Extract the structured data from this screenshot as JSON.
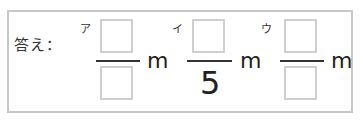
{
  "answer": {
    "label": "答え：",
    "fractions": [
      {
        "tag": "ア",
        "numerator": "",
        "denominator": "",
        "unit": "m"
      },
      {
        "tag": "イ",
        "numerator": "",
        "denominator": "5",
        "unit": "m"
      },
      {
        "tag": "ウ",
        "numerator": "",
        "denominator": "",
        "unit": "m"
      }
    ]
  }
}
